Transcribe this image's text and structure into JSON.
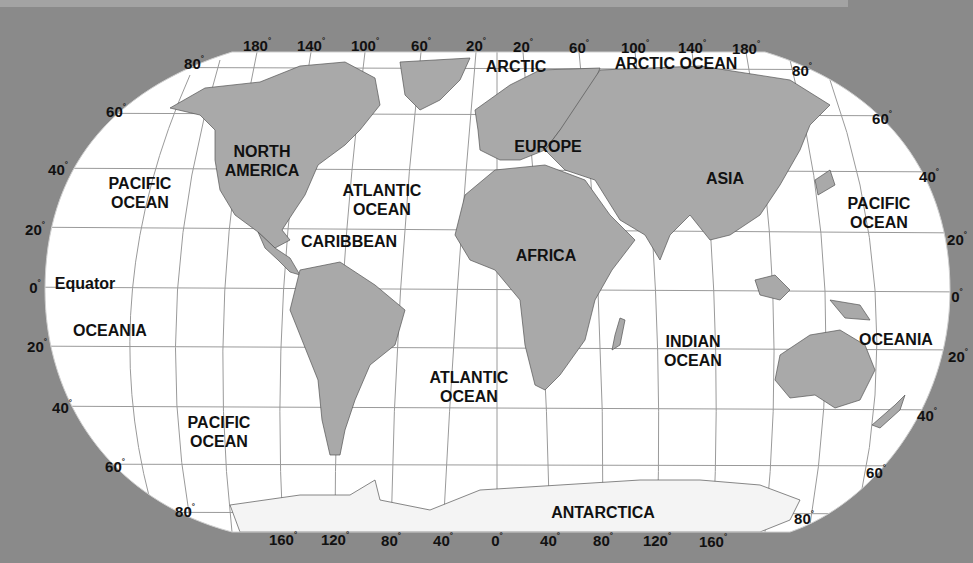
{
  "colors": {
    "background": "#8a8a8a",
    "ocean": "#ffffff",
    "land": "#a9a9a9",
    "grid": "#8c8c8c",
    "text": "#111111"
  },
  "regions": [
    {
      "id": "arctic",
      "text": "ARCTIC",
      "x": 516,
      "y": 66
    },
    {
      "id": "arctic-ocean",
      "text": "ARCTIC OCEAN",
      "x": 676,
      "y": 63
    },
    {
      "id": "north-america",
      "text": "NORTH\nAMERICA",
      "x": 262,
      "y": 161
    },
    {
      "id": "europe",
      "text": "EUROPE",
      "x": 548,
      "y": 146
    },
    {
      "id": "asia",
      "text": "ASIA",
      "x": 725,
      "y": 178
    },
    {
      "id": "pacific-ocean-nw",
      "text": "PACIFIC\nOCEAN",
      "x": 140,
      "y": 193
    },
    {
      "id": "atlantic-ocean-n",
      "text": "ATLANTIC\nOCEAN",
      "x": 382,
      "y": 200
    },
    {
      "id": "pacific-ocean-ne",
      "text": "PACIFIC\nOCEAN",
      "x": 879,
      "y": 213
    },
    {
      "id": "caribbean",
      "text": "CARIBBEAN",
      "x": 349,
      "y": 241
    },
    {
      "id": "africa",
      "text": "AFRICA",
      "x": 546,
      "y": 255
    },
    {
      "id": "equator",
      "text": "Equator",
      "x": 85,
      "y": 283
    },
    {
      "id": "oceania-w",
      "text": "OCEANIA",
      "x": 110,
      "y": 330
    },
    {
      "id": "oceania-e",
      "text": "OCEANIA",
      "x": 896,
      "y": 339
    },
    {
      "id": "indian-ocean",
      "text": "INDIAN\nOCEAN",
      "x": 693,
      "y": 351
    },
    {
      "id": "atlantic-ocean-s",
      "text": "ATLANTIC\nOCEAN",
      "x": 469,
      "y": 387
    },
    {
      "id": "pacific-ocean-s",
      "text": "PACIFIC\nOCEAN",
      "x": 219,
      "y": 432
    },
    {
      "id": "antarctica",
      "text": "ANTARCTICA",
      "x": 603,
      "y": 512
    }
  ],
  "longitude_top": [
    {
      "text": "180",
      "x": 257,
      "y": 45
    },
    {
      "text": "140",
      "x": 311,
      "y": 45
    },
    {
      "text": "100",
      "x": 365,
      "y": 45
    },
    {
      "text": "60",
      "x": 421,
      "y": 45
    },
    {
      "text": "20",
      "x": 476,
      "y": 45
    },
    {
      "text": "20",
      "x": 523,
      "y": 46
    },
    {
      "text": "60",
      "x": 579,
      "y": 47
    },
    {
      "text": "100",
      "x": 635,
      "y": 47
    },
    {
      "text": "140",
      "x": 692,
      "y": 47
    },
    {
      "text": "180",
      "x": 746,
      "y": 48
    }
  ],
  "longitude_bottom": [
    {
      "text": "160",
      "x": 283,
      "y": 539
    },
    {
      "text": "120",
      "x": 335,
      "y": 539
    },
    {
      "text": "80",
      "x": 391,
      "y": 540
    },
    {
      "text": "40",
      "x": 443,
      "y": 540
    },
    {
      "text": "0",
      "x": 497,
      "y": 540
    },
    {
      "text": "40",
      "x": 550,
      "y": 540
    },
    {
      "text": "80",
      "x": 603,
      "y": 540
    },
    {
      "text": "120",
      "x": 657,
      "y": 540
    },
    {
      "text": "160",
      "x": 713,
      "y": 541
    }
  ],
  "latitude_left": [
    {
      "text": "80",
      "x": 194,
      "y": 63
    },
    {
      "text": "60",
      "x": 116,
      "y": 111
    },
    {
      "text": "40",
      "x": 58,
      "y": 169
    },
    {
      "text": "20",
      "x": 35,
      "y": 229
    },
    {
      "text": "0",
      "x": 35,
      "y": 287
    },
    {
      "text": "20",
      "x": 37,
      "y": 346
    },
    {
      "text": "40",
      "x": 62,
      "y": 407
    },
    {
      "text": "60",
      "x": 115,
      "y": 466
    },
    {
      "text": "80",
      "x": 185,
      "y": 511
    }
  ],
  "latitude_right": [
    {
      "text": "80",
      "x": 802,
      "y": 70
    },
    {
      "text": "60",
      "x": 882,
      "y": 118
    },
    {
      "text": "40",
      "x": 929,
      "y": 176
    },
    {
      "text": "20",
      "x": 957,
      "y": 239
    },
    {
      "text": "0",
      "x": 957,
      "y": 296
    },
    {
      "text": "20",
      "x": 958,
      "y": 356
    },
    {
      "text": "40",
      "x": 927,
      "y": 415
    },
    {
      "text": "60",
      "x": 876,
      "y": 472
    },
    {
      "text": "80",
      "x": 804,
      "y": 518
    }
  ]
}
